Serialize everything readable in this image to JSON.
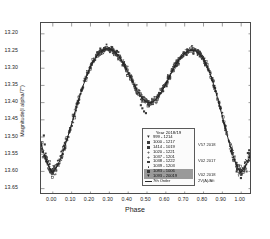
{
  "chart_data": {
    "type": "scatter",
    "title": "",
    "xlabel": "Phase",
    "ylabel": "Magnitude(I alpha/7\")",
    "xlim": [
      -0.06,
      1.06
    ],
    "ylim_display": [
      13.17,
      13.67
    ],
    "y_inverted": true,
    "grid": false,
    "xticks": [
      "0.00",
      "0.10",
      "0.20",
      "0.30",
      "0.40",
      "0.50",
      "0.60",
      "0.70",
      "0.80",
      "0.90",
      "1.00"
    ],
    "xtick_values": [
      0.0,
      0.1,
      0.2,
      0.3,
      0.4,
      0.5,
      0.6,
      0.7,
      0.8,
      0.9,
      1.0
    ],
    "yticks": [
      "13.20",
      "13.25",
      "13.30",
      "13.35",
      "13.40",
      "13.45",
      "13.50",
      "13.55",
      "13.60",
      "13.65"
    ],
    "ytick_values": [
      13.2,
      13.25,
      13.3,
      13.35,
      13.4,
      13.45,
      13.5,
      13.55,
      13.6,
      13.65
    ],
    "legend_position": "lower-right-inside",
    "fit_curve": {
      "name": "7th Order",
      "x": [
        0.0,
        0.02,
        0.04,
        0.06,
        0.08,
        0.1,
        0.12,
        0.14,
        0.16,
        0.18,
        0.2,
        0.22,
        0.24,
        0.26,
        0.28,
        0.3,
        0.32,
        0.34,
        0.36,
        0.38,
        0.4,
        0.42,
        0.44,
        0.46,
        0.48,
        0.5,
        0.52,
        0.54,
        0.56,
        0.58,
        0.6,
        0.62,
        0.64,
        0.66,
        0.68,
        0.7,
        0.72,
        0.74,
        0.76,
        0.78,
        0.8,
        0.82,
        0.84,
        0.86,
        0.88,
        0.9,
        0.92,
        0.94,
        0.96,
        0.98,
        1.0
      ],
      "y": [
        13.605,
        13.592,
        13.57,
        13.54,
        13.505,
        13.468,
        13.43,
        13.393,
        13.358,
        13.327,
        13.3,
        13.279,
        13.263,
        13.252,
        13.246,
        13.245,
        13.249,
        13.258,
        13.272,
        13.29,
        13.311,
        13.333,
        13.355,
        13.375,
        13.391,
        13.4,
        13.402,
        13.397,
        13.386,
        13.37,
        13.35,
        13.328,
        13.306,
        13.287,
        13.271,
        13.259,
        13.252,
        13.249,
        13.251,
        13.259,
        13.273,
        13.294,
        13.321,
        13.355,
        13.394,
        13.436,
        13.479,
        13.52,
        13.557,
        13.586,
        13.605
      ]
    },
    "series": [
      {
        "name": "999 - 1214",
        "marker": "triangle-down",
        "right_note": ""
      },
      {
        "name": "1000 - 1217",
        "marker": "square",
        "right_note": "V57 2018"
      },
      {
        "name": "1414 - 1019",
        "marker": "square",
        "right_note": ""
      },
      {
        "name": "1020 - 1221",
        "marker": "plus",
        "right_note": ""
      },
      {
        "name": "1037 - 1201",
        "marker": "plus",
        "right_note": ""
      },
      {
        "name": "1038 - 1222",
        "marker": "square",
        "right_note": "V02 2017"
      },
      {
        "name": "1039 - 1203",
        "marker": "dot",
        "right_note": ""
      },
      {
        "name": "1083 - 1006",
        "marker": "square",
        "right_note": "V02 2018"
      },
      {
        "name": "1093 - 20019",
        "marker": "triangle-down",
        "right_note": "2V(A)/Afi"
      },
      {
        "name": "7th Order",
        "marker": "line",
        "right_note": ""
      }
    ],
    "notes": [
      "Double-maximum phased light curve",
      "Primary minimum near phase 0.00 at ~13.61 mag",
      "Secondary minimum near phase 0.51 at ~13.40 mag",
      "First maximum near phase 0.29 at ~13.245 mag",
      "Second maximum near phase 0.74 at ~13.249 mag"
    ]
  },
  "legend": {
    "title": "Year  2018/19",
    "rows": [
      {
        "label": "999 - 1214",
        "marker": "triangle-down",
        "highlight": false
      },
      {
        "label": "1000 - 1217",
        "marker": "square",
        "highlight": false
      },
      {
        "label": "1414 - 1019",
        "marker": "square",
        "highlight": false
      },
      {
        "label": "1020 - 1221",
        "marker": "plus",
        "highlight": false
      },
      {
        "label": "1037 - 1201",
        "marker": "plus",
        "highlight": false
      },
      {
        "label": "1038 - 1222",
        "marker": "square",
        "highlight": false
      },
      {
        "label": "1039 - 1203",
        "marker": "dot",
        "highlight": false
      },
      {
        "label": "1083 - 1006",
        "marker": "square",
        "highlight": true
      },
      {
        "label": "1093 - 20019",
        "marker": "triangle-down",
        "highlight": true
      },
      {
        "label": "7th Order",
        "marker": "line",
        "highlight": false
      }
    ]
  },
  "side_notes": [
    {
      "text": "V57 2018",
      "x": 198,
      "y": 142
    },
    {
      "text": "V02 2017",
      "x": 198,
      "y": 158
    },
    {
      "text": "V02 2018",
      "x": 198,
      "y": 172
    },
    {
      "text": "2V(A)/Afi",
      "x": 198,
      "y": 178
    }
  ],
  "style": {
    "marker_color": "#3a3a3a",
    "curve_color": "#1e1e1e",
    "frame_color": "#4a4a4a",
    "background": "#ffffff"
  }
}
